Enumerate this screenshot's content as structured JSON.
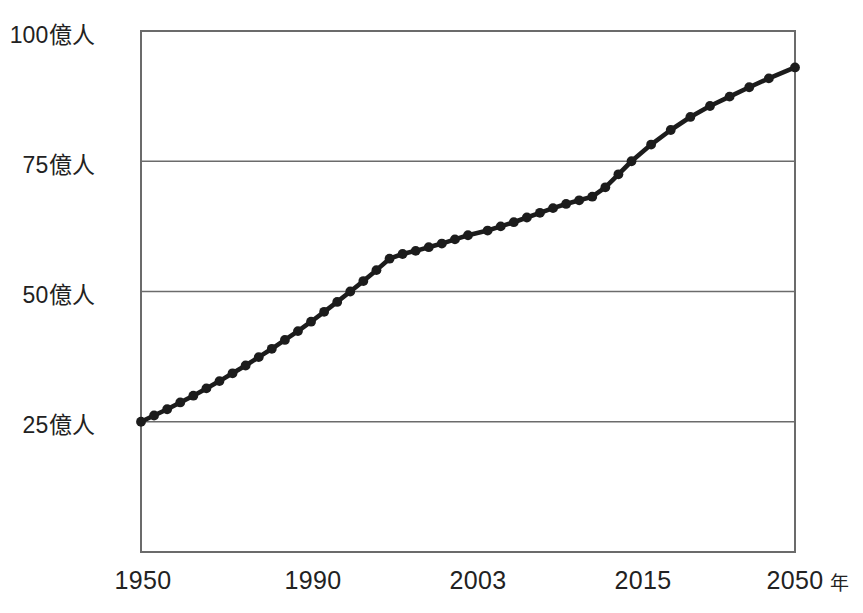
{
  "chart_data": {
    "type": "line",
    "title": "",
    "subtitle": "",
    "xlabel": "年",
    "ylabel": "",
    "xlim": [
      1950,
      2050
    ],
    "ylim": [
      0,
      100
    ],
    "grid": true,
    "legend": null,
    "x_tick_labels": [
      "1950",
      "1990",
      "2003",
      "2015",
      "2050"
    ],
    "x_tick_values": [
      1950,
      1990,
      2003,
      2015,
      2050
    ],
    "y_tick_labels": [
      "25億人",
      "50億人",
      "75億人",
      "100億人"
    ],
    "y_tick_values": [
      25,
      50,
      75,
      100
    ],
    "series": [
      {
        "name": "世界人口",
        "x": [
          1950,
          1952,
          1954,
          1956,
          1958,
          1960,
          1962,
          1964,
          1966,
          1968,
          1970,
          1972,
          1974,
          1976,
          1978,
          1980,
          1982,
          1984,
          1986,
          1988,
          1990,
          1992,
          1994,
          1996,
          1998,
          2000,
          2003,
          2005,
          2007,
          2009,
          2011,
          2013,
          2015,
          2017,
          2019,
          2021,
          2023,
          2025,
          2028,
          2031,
          2034,
          2037,
          2040,
          2043,
          2046,
          2050
        ],
        "values": [
          25.0,
          26.2,
          27.4,
          28.7,
          30.0,
          31.4,
          32.8,
          34.3,
          35.8,
          37.4,
          39.0,
          40.7,
          42.4,
          44.2,
          46.1,
          48.0,
          50.0,
          52.0,
          54.1,
          56.3,
          57.2,
          57.8,
          58.5,
          59.2,
          60.0,
          60.8,
          61.7,
          62.5,
          63.3,
          64.2,
          65.1,
          66.0,
          66.8,
          67.5,
          68.2,
          70.0,
          72.5,
          75.0,
          78.2,
          81.0,
          83.5,
          85.6,
          87.4,
          89.2,
          90.9,
          93.0
        ]
      }
    ]
  },
  "axis": {
    "x_unit_label": "年"
  }
}
